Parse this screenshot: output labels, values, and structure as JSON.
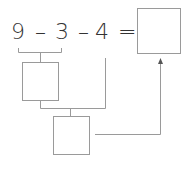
{
  "equation": {
    "tokens": [
      {
        "text": "9",
        "x": 11
      },
      {
        "text": "–",
        "x": 35
      },
      {
        "text": "3",
        "x": 55
      },
      {
        "text": "–",
        "x": 78
      },
      {
        "text": "4",
        "x": 95
      },
      {
        "text": "=",
        "x": 118
      }
    ],
    "answer_box": {
      "value": ""
    }
  },
  "intermediate_boxes": [
    {
      "value": ""
    },
    {
      "value": ""
    }
  ],
  "colors": {
    "line": "#9a9a9a",
    "text": "#333333"
  }
}
